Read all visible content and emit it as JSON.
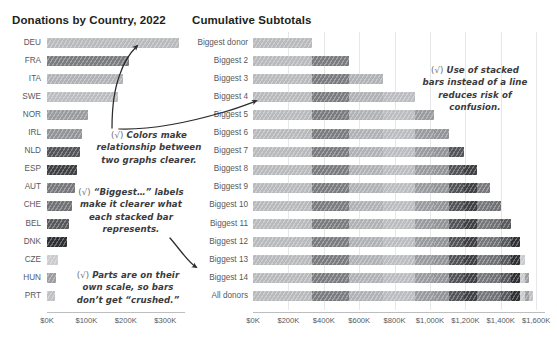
{
  "chart_data": [
    {
      "type": "bar",
      "title": "Donations by Country, 2022",
      "orientation": "horizontal",
      "xlabel": "",
      "ylabel": "",
      "xlim": [
        0,
        340
      ],
      "xticks": [
        0,
        100,
        200,
        300
      ],
      "xticklabels": [
        "$0K",
        "$100K",
        "$200K",
        "$300K"
      ],
      "grid": false,
      "units": "thousands of USD",
      "categories": [
        "DEU",
        "FRA",
        "ITA",
        "SWE",
        "NOR",
        "IRL",
        "NLD",
        "ESP",
        "AUT",
        "CHE",
        "BEL",
        "DNK",
        "CZE",
        "HUN",
        "PRT"
      ],
      "values": [
        335,
        207,
        192,
        181,
        105,
        90,
        83,
        75,
        70,
        63,
        57,
        50,
        28,
        24,
        20
      ],
      "colors": [
        "#b9babc",
        "#7b7c7f",
        "#b1b2b5",
        "#bcbdc0",
        "#9a9b9e",
        "#939497",
        "#535457",
        "#3f4043",
        "#77787b",
        "#707174",
        "#58595c",
        "#2f3033",
        "#cacbcd",
        "#9c9da0",
        "#c0c1c3"
      ]
    },
    {
      "type": "bar",
      "subtype": "stacked",
      "title": "Cumulative Subtotals",
      "orientation": "horizontal",
      "xlabel": "",
      "ylabel": "",
      "xlim": [
        0,
        1650
      ],
      "xticks": [
        0,
        200,
        400,
        600,
        800,
        1000,
        1200,
        1400,
        1600
      ],
      "xticklabels": [
        "$0K",
        "$200K",
        "$400K",
        "$600K",
        "$800K",
        "$1,000K",
        "$1,200K",
        "$1,400K",
        "$1,600K"
      ],
      "grid": true,
      "units": "thousands of USD",
      "categories": [
        "Biggest donor",
        "Biggest 2",
        "Biggest 3",
        "Biggest 4",
        "Biggest 5",
        "Biggest 6",
        "Biggest 7",
        "Biggest 8",
        "Biggest 9",
        "Biggest 10",
        "Biggest 11",
        "Biggest 12",
        "Biggest 13",
        "Biggest 14",
        "All donors"
      ],
      "stack_order": [
        "DEU",
        "FRA",
        "ITA",
        "SWE",
        "NOR",
        "IRL",
        "NLD",
        "ESP",
        "AUT",
        "CHE",
        "BEL",
        "DNK",
        "CZE",
        "HUN",
        "PRT"
      ],
      "stack_colors": [
        "#b9babc",
        "#7b7c7f",
        "#b1b2b5",
        "#bcbdc0",
        "#9a9b9e",
        "#939497",
        "#535457",
        "#3f4043",
        "#77787b",
        "#707174",
        "#58595c",
        "#2f3033",
        "#cacbcd",
        "#9c9da0",
        "#c0c1c3"
      ],
      "rows": [
        {
          "label": "Biggest donor",
          "segments": [
            335
          ],
          "total": 335
        },
        {
          "label": "Biggest 2",
          "segments": [
            335,
            207
          ],
          "total": 542
        },
        {
          "label": "Biggest 3",
          "segments": [
            335,
            207,
            192
          ],
          "total": 734
        },
        {
          "label": "Biggest 4",
          "segments": [
            335,
            207,
            192,
            181
          ],
          "total": 915
        },
        {
          "label": "Biggest 5",
          "segments": [
            335,
            207,
            192,
            181,
            105
          ],
          "total": 1020
        },
        {
          "label": "Biggest 6",
          "segments": [
            335,
            207,
            192,
            181,
            105,
            90
          ],
          "total": 1110
        },
        {
          "label": "Biggest 7",
          "segments": [
            335,
            207,
            192,
            181,
            105,
            90,
            83
          ],
          "total": 1193
        },
        {
          "label": "Biggest 8",
          "segments": [
            335,
            207,
            192,
            181,
            105,
            90,
            83,
            75
          ],
          "total": 1268
        },
        {
          "label": "Biggest 9",
          "segments": [
            335,
            207,
            192,
            181,
            105,
            90,
            83,
            75,
            70
          ],
          "total": 1338
        },
        {
          "label": "Biggest 10",
          "segments": [
            335,
            207,
            192,
            181,
            105,
            90,
            83,
            75,
            70,
            63
          ],
          "total": 1401
        },
        {
          "label": "Biggest 11",
          "segments": [
            335,
            207,
            192,
            181,
            105,
            90,
            83,
            75,
            70,
            63,
            57
          ],
          "total": 1458
        },
        {
          "label": "Biggest 12",
          "segments": [
            335,
            207,
            192,
            181,
            105,
            90,
            83,
            75,
            70,
            63,
            57,
            50
          ],
          "total": 1508
        },
        {
          "label": "Biggest 13",
          "segments": [
            335,
            207,
            192,
            181,
            105,
            90,
            83,
            75,
            70,
            63,
            57,
            50,
            28
          ],
          "total": 1536
        },
        {
          "label": "Biggest 14",
          "segments": [
            335,
            207,
            192,
            181,
            105,
            90,
            83,
            75,
            70,
            63,
            57,
            50,
            28,
            24
          ],
          "total": 1560
        },
        {
          "label": "All donors",
          "segments": [
            335,
            207,
            192,
            181,
            105,
            90,
            83,
            75,
            70,
            63,
            57,
            50,
            28,
            24,
            20
          ],
          "total": 1580
        }
      ]
    }
  ],
  "annotations": [
    {
      "id": "colors",
      "check": "(√)",
      "lines": [
        "Colors make",
        "relationship between",
        "two graphs clearer."
      ]
    },
    {
      "id": "labels",
      "check": "(√)",
      "lines": [
        "“Biggest…” labels",
        "make it clearer what",
        "each stacked bar",
        "represents."
      ]
    },
    {
      "id": "scale",
      "check": "(√)",
      "lines": [
        "Parts are on their",
        "own scale, so bars",
        "don’t get “crushed.”"
      ]
    },
    {
      "id": "stacked",
      "check": "(√)",
      "lines": [
        "Use of stacked",
        "bars instead of a line",
        "reduces risk of",
        "confusion."
      ]
    }
  ]
}
